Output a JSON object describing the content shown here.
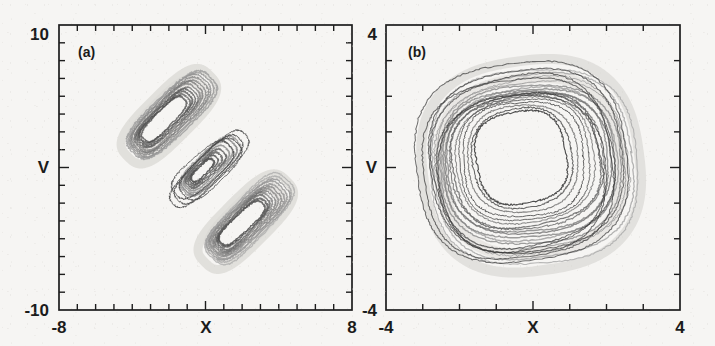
{
  "figure": {
    "background_color": "#f6f5f3",
    "ink_color": "#1d1d1d",
    "width": 715,
    "height": 346
  },
  "chart_data": [
    {
      "type": "line",
      "panel_label": "(a)",
      "title": "",
      "xlabel": "X",
      "ylabel": "V",
      "xlim": [
        -8,
        8
      ],
      "ylim": [
        -10,
        10
      ],
      "xticklabels": [
        "-8",
        "8"
      ],
      "yticklabels": [
        "-10",
        "10"
      ],
      "x_tick_intervals": 16,
      "y_tick_intervals": 16,
      "grid": false,
      "legend": "none",
      "description": "Two-lobe (double-scroll) chaotic attractor in the X-V phase plane; nested rounded-rectangular loops tilted about -45 degrees, an upper-left lobe and a lower-right lobe overlapping near the origin.",
      "series": [
        {
          "name": "upper-left-lobe",
          "center": [
            -2.0,
            3.6
          ],
          "tilt_deg": -45,
          "loops": 11,
          "loop_half_width": [
            1.55,
            2.85
          ],
          "loop_half_height": [
            0.55,
            1.35
          ],
          "shade_range": [
            "#3a3a3a",
            "#9a9a9a"
          ]
        },
        {
          "name": "lower-right-lobe",
          "center": [
            2.2,
            -3.8
          ],
          "tilt_deg": -45,
          "loops": 11,
          "loop_half_width": [
            1.55,
            2.85
          ],
          "loop_half_height": [
            0.55,
            1.35
          ],
          "shade_range": [
            "#444444",
            "#a8a8a8"
          ]
        },
        {
          "name": "inner-core-loops",
          "center": [
            0.1,
            -0.1
          ],
          "tilt_deg": -45,
          "loops": 7,
          "loop_half_width": [
            0.8,
            1.9
          ],
          "loop_half_height": [
            0.35,
            0.95
          ],
          "shade_range": [
            "#3c3c3c",
            "#8e8e8e"
          ]
        }
      ]
    },
    {
      "type": "line",
      "panel_label": "(b)",
      "title": "",
      "xlabel": "X",
      "ylabel": "V",
      "xlim": [
        -4,
        4
      ],
      "ylim": [
        -4,
        4
      ],
      "xticklabels": [
        "-4",
        "4"
      ],
      "yticklabels": [
        "-4",
        "4"
      ],
      "x_tick_intervals": 8,
      "y_tick_intervals": 8,
      "grid": false,
      "legend": "none",
      "description": "Single-band annular chaotic attractor in the X-V phase plane; concentric rounded-diamond (square rotated 45 degrees) loops enclosing an empty core, slightly tilted with heavier ink on the left and lower-right edges.",
      "series": [
        {
          "name": "annular-diamond-loops",
          "center": [
            -0.05,
            0.1
          ],
          "tilt_deg": -8,
          "loops": 16,
          "loop_radius_range": [
            1.25,
            2.95
          ],
          "corner_rounding": 0.55,
          "shade_range": [
            "#333333",
            "#b0b0b0"
          ]
        }
      ]
    }
  ],
  "panels": [
    {
      "id": "a",
      "tag": "(a)",
      "y_top_label": "10",
      "y_bottom_label": "-10",
      "x_left_label": "-8",
      "x_right_label": "8",
      "x_axis_title": "X",
      "y_axis_title": "V"
    },
    {
      "id": "b",
      "tag": "(b)",
      "y_top_label": "4",
      "y_bottom_label": "-4",
      "x_left_label": "-4",
      "x_right_label": "4",
      "x_axis_title": "X",
      "y_axis_title": "V"
    }
  ]
}
